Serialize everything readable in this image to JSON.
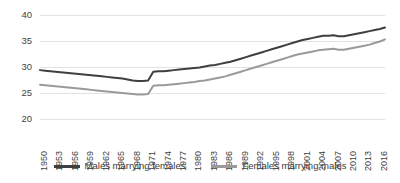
{
  "chart_data": {
    "type": "line",
    "title": "",
    "subtitle": "",
    "xlabel": "",
    "ylabel": "",
    "ylim": [
      20,
      40
    ],
    "yticks": [
      20,
      25,
      30,
      35,
      40
    ],
    "grid": true,
    "legend_position": "bottom",
    "xlim": [
      1950,
      2017
    ],
    "xtick_labels": [
      "1950",
      "1953",
      "1956",
      "1959",
      "1962",
      "1965",
      "1968",
      "1971",
      "1974",
      "1977",
      "1980",
      "1983",
      "1986",
      "1989",
      "1992",
      "1995",
      "1998",
      "2001",
      "2004",
      "2007",
      "2010",
      "2013",
      "2016"
    ],
    "x": [
      1950,
      1951,
      1952,
      1953,
      1954,
      1955,
      1956,
      1957,
      1958,
      1959,
      1960,
      1961,
      1962,
      1963,
      1964,
      1965,
      1966,
      1967,
      1968,
      1969,
      1970,
      1971,
      1972,
      1973,
      1974,
      1975,
      1976,
      1977,
      1978,
      1979,
      1980,
      1981,
      1982,
      1983,
      1984,
      1985,
      1986,
      1987,
      1988,
      1989,
      1990,
      1991,
      1992,
      1993,
      1994,
      1995,
      1996,
      1997,
      1998,
      1999,
      2000,
      2001,
      2002,
      2003,
      2004,
      2005,
      2006,
      2007,
      2008,
      2009,
      2010,
      2011,
      2012,
      2013,
      2014,
      2015,
      2016,
      2017
    ],
    "series": [
      {
        "name": "Males marrying females",
        "color": "#3f3f3f",
        "values": [
          29.4,
          29.3,
          29.2,
          29.1,
          29.0,
          28.9,
          28.8,
          28.7,
          28.6,
          28.5,
          28.4,
          28.3,
          28.2,
          28.1,
          28.0,
          27.9,
          27.8,
          27.6,
          27.4,
          27.3,
          27.3,
          27.4,
          29.1,
          29.2,
          29.2,
          29.3,
          29.4,
          29.5,
          29.6,
          29.7,
          29.8,
          29.9,
          30.1,
          30.3,
          30.4,
          30.6,
          30.8,
          31.0,
          31.3,
          31.6,
          31.9,
          32.2,
          32.5,
          32.8,
          33.1,
          33.4,
          33.7,
          34.0,
          34.3,
          34.6,
          34.9,
          35.2,
          35.4,
          35.6,
          35.8,
          36.0,
          36.0,
          36.1,
          35.9,
          35.9,
          36.1,
          36.3,
          36.5,
          36.7,
          36.9,
          37.1,
          37.3,
          37.6
        ]
      },
      {
        "name": "Females marrying males",
        "color": "#9a9a9a",
        "values": [
          26.6,
          26.5,
          26.4,
          26.3,
          26.2,
          26.1,
          26.0,
          25.9,
          25.8,
          25.7,
          25.6,
          25.5,
          25.4,
          25.3,
          25.2,
          25.1,
          25.0,
          24.9,
          24.8,
          24.7,
          24.7,
          24.8,
          26.4,
          26.5,
          26.5,
          26.6,
          26.7,
          26.8,
          26.9,
          27.0,
          27.1,
          27.3,
          27.4,
          27.6,
          27.8,
          28.0,
          28.2,
          28.5,
          28.8,
          29.1,
          29.4,
          29.7,
          30.0,
          30.3,
          30.6,
          30.9,
          31.2,
          31.5,
          31.8,
          32.1,
          32.4,
          32.6,
          32.8,
          33.0,
          33.2,
          33.3,
          33.4,
          33.5,
          33.3,
          33.3,
          33.5,
          33.7,
          33.9,
          34.1,
          34.3,
          34.6,
          34.9,
          35.3
        ]
      }
    ]
  },
  "legend": {
    "items": [
      {
        "label": "Males marrying females",
        "color": "#3f3f3f"
      },
      {
        "label": "Females marrying males",
        "color": "#9a9a9a"
      }
    ]
  }
}
